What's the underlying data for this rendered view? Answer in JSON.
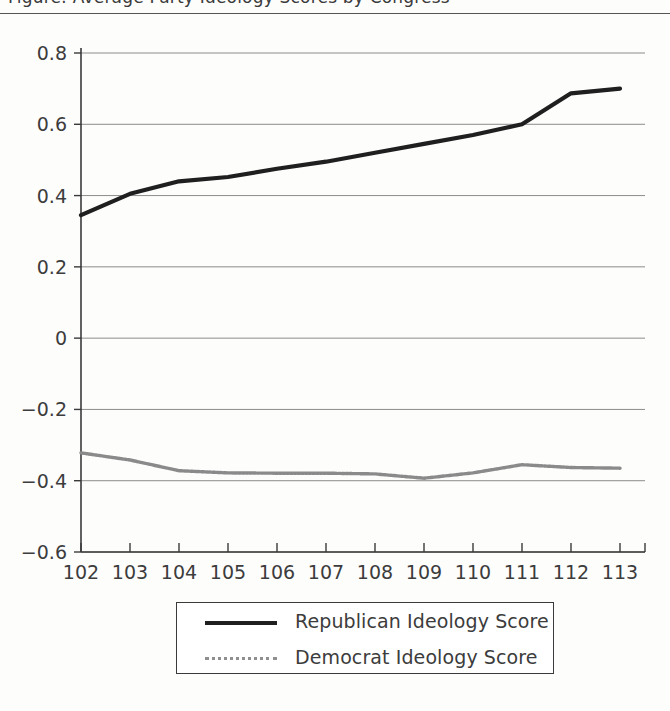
{
  "page": {
    "title_fragment": "Figure: Average Party Ideology Scores by Congress",
    "background": "#fdfdfc"
  },
  "colors": {
    "republican_line": "#1f1f1f",
    "democrat_line": "#8a8a8a",
    "gridline": "#8c8c8c",
    "axis": "#3a3a3a",
    "text": "#3c3c3c"
  },
  "legend": {
    "position": "bottom-center",
    "entries": [
      {
        "label": "Republican Ideology Score",
        "style": "solid",
        "color": "#1f1f1f"
      },
      {
        "label": "Democrat Ideology Score",
        "style": "dotted",
        "color": "#8a8a8a"
      }
    ]
  },
  "axes": {
    "y_ticks": [
      "0.8",
      "0.6",
      "0.4",
      "0.2",
      "0",
      "-0.2",
      "-0.4",
      "-0.6"
    ],
    "x_ticks": [
      "102",
      "103",
      "104",
      "105",
      "106",
      "107",
      "108",
      "109",
      "110",
      "111",
      "112",
      "113"
    ]
  },
  "chart_data": {
    "type": "line",
    "title": "Average Party Ideology Scores by Congress",
    "xlabel": "",
    "ylabel": "",
    "xlim": [
      102,
      113
    ],
    "ylim": [
      -0.6,
      0.8
    ],
    "grid": true,
    "legend_position": "bottom-center",
    "categories": [
      102,
      103,
      104,
      105,
      106,
      107,
      108,
      109,
      110,
      111,
      112,
      113
    ],
    "series": [
      {
        "name": "Republican Ideology Score",
        "color": "#1f1f1f",
        "style": "solid",
        "values": [
          0.345,
          0.405,
          0.44,
          0.452,
          0.475,
          0.495,
          0.52,
          0.545,
          0.57,
          0.6,
          0.687,
          0.7
        ]
      },
      {
        "name": "Democrat Ideology Score",
        "color": "#8a8a8a",
        "style": "dotted",
        "values": [
          -0.322,
          -0.342,
          -0.372,
          -0.378,
          -0.379,
          -0.379,
          -0.381,
          -0.393,
          -0.378,
          -0.355,
          -0.363,
          -0.365
        ]
      }
    ]
  }
}
